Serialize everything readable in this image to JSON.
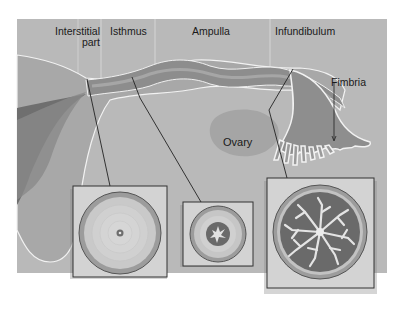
{
  "colors": {
    "background": "#b9b9b9",
    "page": "#ffffff",
    "tube_outer": "#8f8f8f",
    "tube_inner": "#a3a3a3",
    "uterus_dark": "#6d6d6d",
    "ovary": "#a6a6a6",
    "inset_bg": "#d4d4d4",
    "inset_border": "#333333",
    "mucosa_dark": "#6a6a6a"
  },
  "regions": [
    {
      "label_line1": "Interstitial",
      "label_line2": "part"
    },
    {
      "label_line1": "Isthmus"
    },
    {
      "label_line1": "Ampulla"
    },
    {
      "label_line1": "Infundibulum"
    }
  ],
  "annotations": {
    "fimbria": "Fimbria",
    "ovary": "Ovary"
  },
  "cross_sections": [
    {
      "name": "interstitial-cross-section",
      "lumen": "tiny"
    },
    {
      "name": "isthmus-cross-section",
      "lumen": "small folded"
    },
    {
      "name": "ampulla-infundibulum-cross-section",
      "lumen": "highly branched folds"
    }
  ]
}
